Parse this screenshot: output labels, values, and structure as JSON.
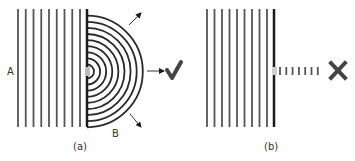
{
  "figure": {
    "panels": [
      {
        "id": "a",
        "caption": "(a)",
        "labels": {
          "incoming": "A",
          "outgoing": "B"
        },
        "wavefront_count": 9,
        "circular_wave_count": 9,
        "result_symbol": "check-mark",
        "result": "✔"
      },
      {
        "id": "b",
        "caption": "(b)",
        "wavefront_count": 9,
        "transmitted_dash_count": 7,
        "result_symbol": "cross-mark",
        "result": "✖"
      }
    ],
    "colors": {
      "wavefront": "#555555",
      "barrier": "#1a1a1a",
      "arc": "#2a2a2a",
      "gap": "#bdbdbd",
      "symbol": "#444444"
    }
  }
}
